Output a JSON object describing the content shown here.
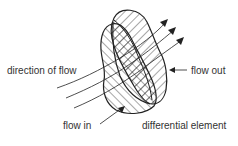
{
  "diagram": {
    "type": "control-volume flow diagram",
    "labels": {
      "direction_of_flow": "direction of flow",
      "flow_out": "flow out",
      "flow_in": "flow in",
      "differential_element": "differential element"
    },
    "colors": {
      "stroke": "#222222",
      "text": "#333333",
      "background": "#ffffff"
    }
  }
}
